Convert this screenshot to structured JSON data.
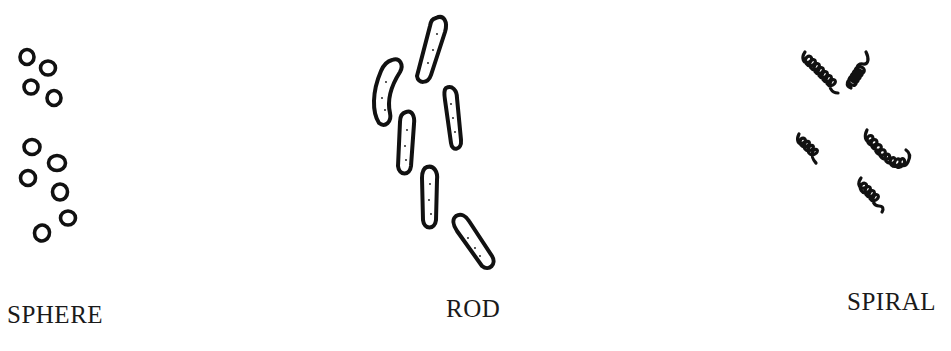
{
  "panels": [
    {
      "id": "sphere",
      "label": "SPHERE",
      "count": 10
    },
    {
      "id": "rod",
      "label": "ROD",
      "count": 6
    },
    {
      "id": "spiral",
      "label": "SPIRAL",
      "count": 5
    }
  ],
  "colors": {
    "ink": "#111111",
    "background": "#ffffff"
  }
}
